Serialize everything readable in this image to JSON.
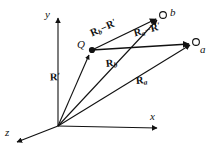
{
  "figure": {
    "type": "vector-diagram",
    "background_color": "#ffffff",
    "stroke_color": "#111111"
  },
  "axes": {
    "origin": {
      "label": "O",
      "x": 58,
      "y": 126
    },
    "items": [
      {
        "name": "y-axis",
        "label": "y",
        "tip_x": 58,
        "tip_y": 16,
        "label_x": 45,
        "label_y": 10
      },
      {
        "name": "x-axis",
        "label": "x",
        "tip_x": 160,
        "tip_y": 128,
        "label_x": 152,
        "label_y": 113
      },
      {
        "name": "z-axis",
        "label": "z",
        "tip_x": 14,
        "tip_y": 143,
        "label_x": 6,
        "label_y": 128
      }
    ]
  },
  "points": [
    {
      "name": "Q",
      "label": "Q",
      "marker": "filled-dot",
      "x": 92,
      "y": 50,
      "label_x": 78,
      "label_y": 40
    },
    {
      "name": "b",
      "label": "b",
      "marker": "open-circle",
      "x": 161,
      "y": 16,
      "label_x": 170,
      "label_y": 8
    },
    {
      "name": "a",
      "label": "a",
      "marker": "open-circle",
      "x": 194,
      "y": 43,
      "label_x": 199,
      "label_y": 44
    }
  ],
  "vectors": [
    {
      "name": "R-prime",
      "parts": [
        {
          "text": "R",
          "style": "vec"
        },
        {
          "text": "′",
          "style": "prime"
        }
      ],
      "from": "origin",
      "to": "Q",
      "label_x": 54,
      "label_y": 73,
      "rotation_class": "rot-rp"
    },
    {
      "name": "R-b",
      "parts": [
        {
          "text": "R",
          "style": "vec"
        },
        {
          "text": "b",
          "style": "sub"
        }
      ],
      "from": "origin",
      "to": "b",
      "label_x": 109,
      "label_y": 60,
      "rotation_class": "rot-rbb"
    },
    {
      "name": "R-a",
      "parts": [
        {
          "text": "R",
          "style": "vec"
        },
        {
          "text": "a",
          "style": "sub"
        }
      ],
      "from": "origin",
      "to": "a",
      "label_x": 138,
      "label_y": 77,
      "rotation_class": "rot-raa"
    },
    {
      "name": "R-b-minus-R-prime",
      "parts": [
        {
          "text": "R",
          "style": "vec"
        },
        {
          "text": "b",
          "style": "sub"
        },
        {
          "text": "−",
          "style": "minus"
        },
        {
          "text": "R",
          "style": "vec"
        },
        {
          "text": "′",
          "style": "prime"
        }
      ],
      "from": "Q",
      "to": "b",
      "label_x": 95,
      "label_y": 29,
      "rotation_class": "rot-rb"
    },
    {
      "name": "R-a-minus-R-prime",
      "parts": [
        {
          "text": "R",
          "style": "vec"
        },
        {
          "text": "a",
          "style": "sub"
        },
        {
          "text": "−",
          "style": "minus"
        },
        {
          "text": "R",
          "style": "vec"
        },
        {
          "text": "′",
          "style": "prime"
        }
      ],
      "from": "Q",
      "to": "a",
      "label_x": 138,
      "label_y": 29,
      "rotation_class": "rot-ra"
    }
  ]
}
